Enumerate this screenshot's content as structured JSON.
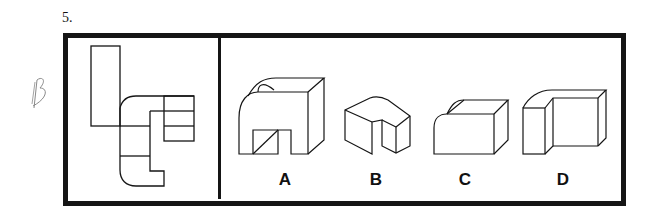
{
  "question": {
    "number": "5.",
    "handwritten_answer": "B",
    "prompt_figure": "unfolded-net-pattern",
    "options": [
      {
        "label": "A",
        "shape": "arched-block-with-notch"
      },
      {
        "label": "B",
        "shape": "rounded-l-block"
      },
      {
        "label": "C",
        "shape": "rounded-edge-box"
      },
      {
        "label": "D",
        "shape": "stepped-rounded-block"
      }
    ]
  },
  "colors": {
    "line": "#151515",
    "background": "#ffffff"
  }
}
